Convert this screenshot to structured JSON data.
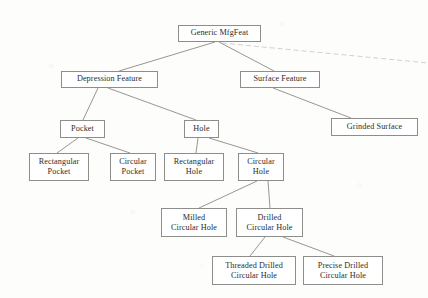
{
  "diagram": {
    "type": "tree-taxonomy",
    "nodes": [
      {
        "id": "generic",
        "label": "Generic MfgFeat",
        "x": 178,
        "y": 25,
        "w": 83,
        "h": 17,
        "lines": 1
      },
      {
        "id": "depression",
        "label": "Depression Feature",
        "x": 61,
        "y": 71,
        "w": 97,
        "h": 17,
        "lines": 1
      },
      {
        "id": "surface",
        "label": "Surface Feature",
        "x": 240,
        "y": 71,
        "w": 80,
        "h": 17,
        "lines": 1
      },
      {
        "id": "pocket",
        "label": "Pocket",
        "x": 60,
        "y": 120,
        "w": 45,
        "h": 18,
        "lines": 1
      },
      {
        "id": "hole",
        "label": "Hole",
        "x": 184,
        "y": 120,
        "w": 35,
        "h": 18,
        "lines": 1
      },
      {
        "id": "grinded",
        "label": "Grinded Surface",
        "x": 331,
        "y": 118,
        "w": 87,
        "h": 18,
        "lines": 1
      },
      {
        "id": "rect-pocket",
        "label": "Rectangular\nPocket",
        "x": 29,
        "y": 153,
        "w": 60,
        "h": 28,
        "lines": 2
      },
      {
        "id": "circ-pocket",
        "label": "Circular\nPocket",
        "x": 110,
        "y": 153,
        "w": 46,
        "h": 28,
        "lines": 2
      },
      {
        "id": "rect-hole",
        "label": "Rectangular\nHole",
        "x": 164,
        "y": 153,
        "w": 60,
        "h": 28,
        "lines": 2
      },
      {
        "id": "circ-hole",
        "label": "Circular\nHole",
        "x": 238,
        "y": 153,
        "w": 46,
        "h": 28,
        "lines": 2
      },
      {
        "id": "milled-circ-hole",
        "label": "Milled\nCircular Hole",
        "x": 161,
        "y": 208,
        "w": 66,
        "h": 29,
        "lines": 2
      },
      {
        "id": "drilled-circ-hole",
        "label": "Drilled\nCircular Hole",
        "x": 236,
        "y": 208,
        "w": 67,
        "h": 29,
        "lines": 2
      },
      {
        "id": "threaded-drilled",
        "label": "Threaded Drilled\nCircular Hole",
        "x": 212,
        "y": 256,
        "w": 84,
        "h": 29,
        "lines": 2
      },
      {
        "id": "precise-drilled",
        "label": "Precise Drilled\nCircular Hole",
        "x": 303,
        "y": 256,
        "w": 80,
        "h": 29,
        "lines": 2
      }
    ],
    "edges": [
      {
        "from": "generic",
        "to": "depression",
        "x1": 215,
        "y1": 42,
        "x2": 119,
        "y2": 71,
        "style": "solid"
      },
      {
        "from": "generic",
        "to": "surface",
        "x1": 219,
        "y1": 42,
        "x2": 274,
        "y2": 71,
        "style": "solid"
      },
      {
        "from": "generic",
        "to": "truncated-branch",
        "x1": 222,
        "y1": 43,
        "x2": 428,
        "y2": 63,
        "style": "faded"
      },
      {
        "from": "depression",
        "to": "pocket",
        "x1": 98,
        "y1": 88,
        "x2": 83,
        "y2": 120,
        "style": "solid"
      },
      {
        "from": "depression",
        "to": "hole",
        "x1": 108,
        "y1": 88,
        "x2": 196,
        "y2": 120,
        "style": "solid"
      },
      {
        "from": "surface",
        "to": "grinded",
        "x1": 273,
        "y1": 88,
        "x2": 351,
        "y2": 118,
        "style": "solid"
      },
      {
        "from": "pocket",
        "to": "rect-pocket",
        "x1": 78,
        "y1": 138,
        "x2": 57,
        "y2": 153,
        "style": "solid"
      },
      {
        "from": "pocket",
        "to": "circ-pocket",
        "x1": 86,
        "y1": 138,
        "x2": 130,
        "y2": 153,
        "style": "solid"
      },
      {
        "from": "hole",
        "to": "rect-hole",
        "x1": 198,
        "y1": 138,
        "x2": 196,
        "y2": 153,
        "style": "solid"
      },
      {
        "from": "hole",
        "to": "circ-hole",
        "x1": 209,
        "y1": 138,
        "x2": 258,
        "y2": 153,
        "style": "solid"
      },
      {
        "from": "circ-hole",
        "to": "milled-circ-hole",
        "x1": 257,
        "y1": 181,
        "x2": 199,
        "y2": 208,
        "style": "solid"
      },
      {
        "from": "circ-hole",
        "to": "drilled-circ-hole",
        "x1": 268,
        "y1": 181,
        "x2": 270,
        "y2": 208,
        "style": "solid"
      },
      {
        "from": "drilled-circ-hole",
        "to": "threaded-drilled",
        "x1": 265,
        "y1": 237,
        "x2": 250,
        "y2": 256,
        "style": "solid"
      },
      {
        "from": "drilled-circ-hole",
        "to": "precise-drilled",
        "x1": 283,
        "y1": 237,
        "x2": 334,
        "y2": 256,
        "style": "solid"
      }
    ],
    "colors": {
      "background": "#fdfdfc",
      "box_border": "#8d8d8a",
      "box_fill": "#ffffff",
      "text": "#2b2b2b",
      "edge": "#8a8a86",
      "edge_faded": "#bdbdb9"
    }
  }
}
